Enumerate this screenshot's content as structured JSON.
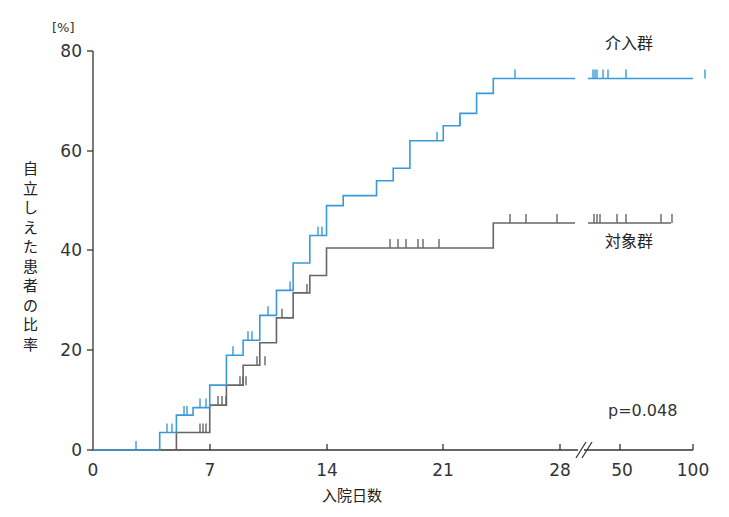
{
  "chart_data": {
    "type": "line",
    "subtype": "kaplan-meier-step",
    "title": "",
    "xlabel": "入院日数",
    "ylabel": "自立しえた患者の比率",
    "y_unit": "[%]",
    "ylim": [
      0,
      80
    ],
    "yticks": [
      0,
      20,
      40,
      60,
      80
    ],
    "xticks": [
      0,
      7,
      14,
      21,
      28,
      50,
      100
    ],
    "x_axis_break": "between 28 and 50",
    "grid": false,
    "annotation": "p=0.048",
    "series": [
      {
        "name": "介入群",
        "color": "#3a9ad9",
        "steps": [
          {
            "x": 0,
            "y": 0
          },
          {
            "x": 4,
            "y": 3.5
          },
          {
            "x": 5,
            "y": 7
          },
          {
            "x": 6,
            "y": 8.5
          },
          {
            "x": 7,
            "y": 13
          },
          {
            "x": 8,
            "y": 19
          },
          {
            "x": 9,
            "y": 22
          },
          {
            "x": 10,
            "y": 27
          },
          {
            "x": 11,
            "y": 32
          },
          {
            "x": 12,
            "y": 37.5
          },
          {
            "x": 13,
            "y": 43
          },
          {
            "x": 14,
            "y": 49
          },
          {
            "x": 15,
            "y": 51
          },
          {
            "x": 17,
            "y": 54
          },
          {
            "x": 18,
            "y": 56.5
          },
          {
            "x": 19,
            "y": 62
          },
          {
            "x": 21,
            "y": 65
          },
          {
            "x": 22,
            "y": 67.5
          },
          {
            "x": 23,
            "y": 71.5
          },
          {
            "x": 24,
            "y": 74.5
          }
        ],
        "end_x": 100,
        "final_value": 74.5
      },
      {
        "name": "対象群",
        "color": "#666666",
        "steps": [
          {
            "x": 0,
            "y": 0
          },
          {
            "x": 5,
            "y": 3.5
          },
          {
            "x": 7,
            "y": 9
          },
          {
            "x": 8,
            "y": 13
          },
          {
            "x": 9,
            "y": 17
          },
          {
            "x": 10,
            "y": 21.5
          },
          {
            "x": 11,
            "y": 26.5
          },
          {
            "x": 12,
            "y": 31.5
          },
          {
            "x": 13,
            "y": 35
          },
          {
            "x": 14,
            "y": 40.5
          },
          {
            "x": 24,
            "y": 45.5
          }
        ],
        "end_x": 85,
        "final_value": 45.5
      }
    ],
    "legend_position": "inline labels at right"
  },
  "labels": {
    "y_unit": "[%]",
    "ylabel": "自立しえた患者の比率",
    "xlabel": "入院日数",
    "p_value": "p=0.048",
    "series_intervention": "介入群",
    "series_control": "対象群",
    "yticks": [
      "0",
      "20",
      "40",
      "60",
      "80"
    ],
    "xticks": [
      "0",
      "7",
      "14",
      "21",
      "28",
      "50",
      "100"
    ]
  }
}
